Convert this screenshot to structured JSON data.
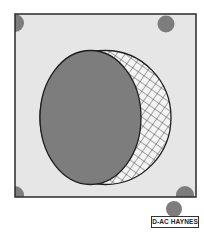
{
  "figure": {
    "label": "D-AC HAYNES",
    "colors": {
      "frame_fill": "#e6e6e6",
      "frame_stroke": "#2a2a2a",
      "solid_fill": "#7d7d7d",
      "hatch_bg": "#f4f4f4",
      "hatch_line": "#2a2a2a",
      "outline": "#1e1e1e",
      "dot_fill": "#7d7d7d"
    },
    "frame": {
      "x": 15,
      "y": 14,
      "width": 181,
      "height": 183
    },
    "outer_ellipse": {
      "cx": 105.5,
      "cy": 117.5,
      "rx": 65.5,
      "ry": 67
    },
    "inner_ellipse": {
      "cx": 90.5,
      "cy": 117.5,
      "rx": 50.5,
      "ry": 67
    },
    "dots": [
      {
        "name": "dot-top-left",
        "cx": 15,
        "cy": 23,
        "r": 9
      },
      {
        "name": "dot-top-right",
        "cx": 166,
        "cy": 24,
        "r": 8.5
      },
      {
        "name": "dot-left",
        "cx": 15,
        "cy": 195,
        "r": 9
      },
      {
        "name": "dot-bottom-right",
        "cx": 185,
        "cy": 195,
        "r": 9
      },
      {
        "name": "dot-bottom-right-lower",
        "cx": 174,
        "cy": 209,
        "r": 8
      }
    ]
  }
}
